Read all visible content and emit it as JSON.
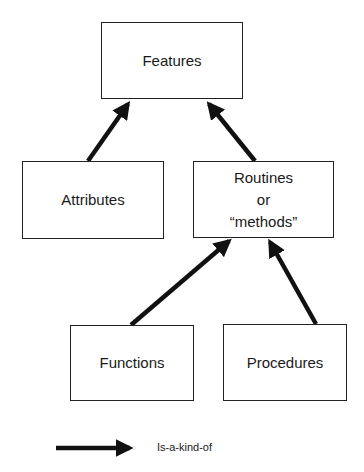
{
  "diagram": {
    "nodes": {
      "features": {
        "label": "Features"
      },
      "attributes": {
        "label": "Attributes"
      },
      "routines": {
        "label": "Routines\nor\n“methods”"
      },
      "functions": {
        "label": "Functions"
      },
      "procedures": {
        "label": "Procedures"
      }
    },
    "edges": [
      {
        "from": "attributes",
        "to": "features",
        "relation": "Is-a-kind-of"
      },
      {
        "from": "routines",
        "to": "features",
        "relation": "Is-a-kind-of"
      },
      {
        "from": "functions",
        "to": "routines",
        "relation": "Is-a-kind-of"
      },
      {
        "from": "procedures",
        "to": "routines",
        "relation": "Is-a-kind-of"
      }
    ],
    "legend": {
      "arrow_label": "Is-a-kind-of"
    },
    "colors": {
      "line": "#111111",
      "background": "#ffffff"
    }
  }
}
